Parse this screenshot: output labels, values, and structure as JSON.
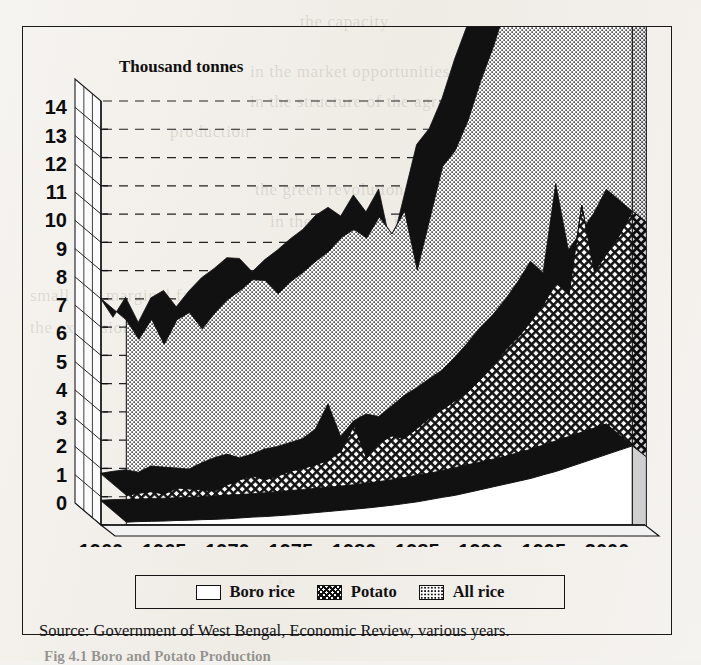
{
  "figure": {
    "axis_title": "Thousand tonnes",
    "source": "Source: Government of West Bengal, Economic Review, various years.",
    "caption": "Fig 4.1  Boro and Potato Production"
  },
  "legend": {
    "items": [
      {
        "label": "Boro rice",
        "swatch": "white-box",
        "color": "#ffffff"
      },
      {
        "label": "Potato",
        "swatch": "crosshatch-box",
        "color": "#111111"
      },
      {
        "label": "All rice",
        "swatch": "dotted-box",
        "color": "#111111"
      }
    ]
  },
  "ghost_text": [
    {
      "text": "the capacity",
      "x": 300,
      "y": 12
    },
    {
      "text": "in the market opportunities",
      "x": 250,
      "y": 62
    },
    {
      "text": "in the structure of the agrarian",
      "x": 250,
      "y": 92
    },
    {
      "text": "production",
      "x": 170,
      "y": 122
    },
    {
      "text": "the green revolution technology",
      "x": 255,
      "y": 180
    },
    {
      "text": "in the 1970s but it was",
      "x": 270,
      "y": 212
    },
    {
      "text": "of the West",
      "x": 300,
      "y": 250
    },
    {
      "text": "small and marginal farmers",
      "x": 30,
      "y": 286
    },
    {
      "text": "the expansion of the",
      "x": 30,
      "y": 318
    },
    {
      "text": "in the irrigated",
      "x": 360,
      "y": 350
    },
    {
      "text": "of the total output",
      "x": 330,
      "y": 400
    },
    {
      "text": "higher yields",
      "x": 250,
      "y": 440
    },
    {
      "text": "in the eastern region",
      "x": 300,
      "y": 470
    }
  ],
  "chart_data": {
    "type": "area",
    "stacked": true,
    "title": "",
    "ylabel": "Thousand tonnes",
    "xlabel": "",
    "ylim": [
      0,
      15
    ],
    "xlim": [
      1960,
      2003
    ],
    "grid": true,
    "grid_axis": "y",
    "legend_position": "bottom",
    "ytick_labels": [
      "0",
      "1",
      "2",
      "3",
      "4",
      "5",
      "6",
      "7",
      "8",
      "9",
      "10",
      "11",
      "12",
      "13",
      "14"
    ],
    "yticks": [
      0,
      1,
      2,
      3,
      4,
      5,
      6,
      7,
      8,
      9,
      10,
      11,
      12,
      13,
      14
    ],
    "xtick_labels": [
      "1960",
      "1965",
      "1970",
      "1975",
      "1980",
      "1985",
      "1990",
      "1995",
      "2000"
    ],
    "xticks": [
      1960,
      1965,
      1970,
      1975,
      1980,
      1985,
      1990,
      1995,
      2000
    ],
    "x": [
      1962,
      1963,
      1964,
      1965,
      1966,
      1967,
      1968,
      1969,
      1970,
      1971,
      1972,
      1973,
      1974,
      1975,
      1976,
      1977,
      1978,
      1979,
      1980,
      1981,
      1982,
      1983,
      1984,
      1985,
      1986,
      1987,
      1988,
      1989,
      1990,
      1991,
      1992,
      1993,
      1994,
      1995,
      1996,
      1997,
      1998,
      1999,
      2000,
      2001,
      2002
    ],
    "series": [
      {
        "name": "Boro rice",
        "pattern": "white-box",
        "values": [
          0.1,
          0.12,
          0.13,
          0.14,
          0.16,
          0.17,
          0.19,
          0.2,
          0.22,
          0.25,
          0.28,
          0.3,
          0.33,
          0.36,
          0.4,
          0.44,
          0.48,
          0.52,
          0.56,
          0.6,
          0.65,
          0.7,
          0.76,
          0.82,
          0.9,
          0.98,
          1.05,
          1.15,
          1.25,
          1.35,
          1.45,
          1.55,
          1.65,
          1.78,
          1.9,
          2.05,
          2.2,
          2.35,
          2.5,
          2.65,
          2.8
        ]
      },
      {
        "name": "Potato",
        "pattern": "crosshatch",
        "values": [
          0.95,
          1.0,
          1.05,
          0.95,
          1.15,
          1.1,
          1.05,
          1.0,
          1.2,
          1.35,
          1.45,
          1.3,
          1.4,
          1.55,
          1.6,
          1.7,
          1.8,
          2.1,
          2.95,
          1.75,
          2.25,
          2.45,
          2.3,
          2.6,
          2.9,
          3.1,
          3.35,
          3.55,
          3.9,
          4.3,
          4.75,
          5.1,
          5.55,
          6.05,
          6.65,
          6.1,
          9.1,
          6.6,
          7.1,
          7.6,
          8.3
        ]
      },
      {
        "name": "All rice",
        "pattern": "dotted",
        "values": [
          6.2,
          5.45,
          6.1,
          5.3,
          5.95,
          6.25,
          5.7,
          6.3,
          6.55,
          6.7,
          6.95,
          7.05,
          6.45,
          6.7,
          6.95,
          7.2,
          7.4,
          7.55,
          6.95,
          7.8,
          8.0,
          7.15,
          8.05,
          5.6,
          7.05,
          8.6,
          8.85,
          9.6,
          10.55,
          11.25,
          12.1,
          11.6,
          12.65,
          12.35,
          13.05,
          12.6,
          13.35,
          13.55,
          14.0,
          14.55,
          14.0
        ]
      }
    ]
  }
}
